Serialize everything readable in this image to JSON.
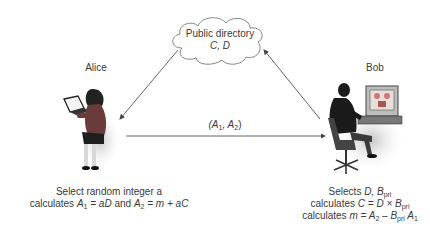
{
  "directory": {
    "title": "Public directory",
    "contents": "C, D"
  },
  "alice": {
    "name": "Alice",
    "caption_line1": "Select random integer a",
    "caption_line2_prefix": "calculates ",
    "caption_A1": "A",
    "caption_A1_sub": "1",
    "caption_eq1": " = aD",
    "caption_and": " and ",
    "caption_A2": "A",
    "caption_A2_sub": "2",
    "caption_eq2": " = m + aC"
  },
  "bob": {
    "name": "Bob",
    "caption_line1_prefix": "Selects ",
    "caption_line1_D": "D, B",
    "caption_line1_sub": "pri",
    "caption_line2_prefix": "calculates ",
    "caption_line2_expr": "C = D × B",
    "caption_line2_sub": "pri",
    "caption_line3_prefix": "calculates ",
    "caption_line3_expr1": "m = A",
    "caption_line3_sub1": "2",
    "caption_line3_minus": " – B",
    "caption_line3_sub2": "pri",
    "caption_line3_expr2": " A",
    "caption_line3_sub3": "1"
  },
  "message": {
    "open": "(A",
    "sub1": "1",
    "sep": ", A",
    "sub2": "2",
    "close": ")"
  },
  "colors": {
    "line": "#555555",
    "text": "#3a3a3a"
  }
}
